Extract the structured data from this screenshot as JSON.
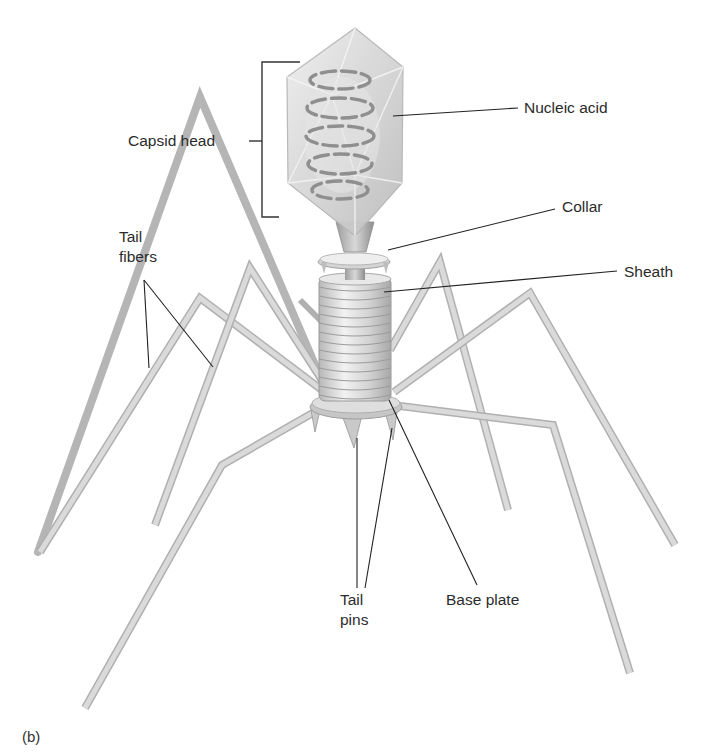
{
  "figure": {
    "panel_label": "(b)"
  },
  "labels": {
    "capsid_head": "Capsid head",
    "nucleic_acid": "Nucleic acid",
    "collar": "Collar",
    "sheath": "Sheath",
    "tail_fibers_line1": "Tail",
    "tail_fibers_line2": "fibers",
    "tail_pins_line1": "Tail",
    "tail_pins_line2": "pins",
    "base_plate": "Base plate"
  },
  "colors": {
    "background": "#ffffff",
    "label_text": "#2b2b2b",
    "leader_line": "#222222",
    "fiber": "#cfcfcf",
    "fiber_edge": "#a9a9a9",
    "capsid_fill": "#dcdcdc",
    "helix": "#9a9a9a"
  }
}
